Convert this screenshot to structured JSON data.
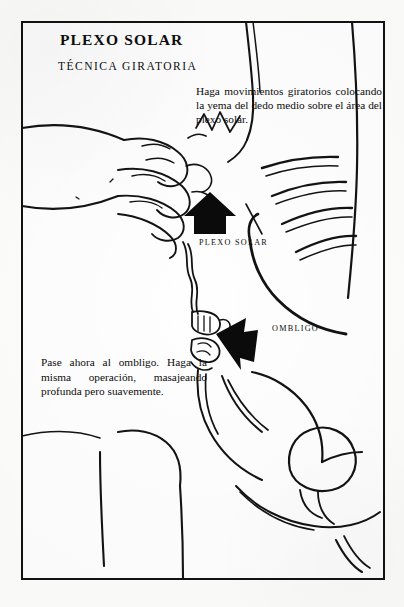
{
  "page": {
    "title": "PLEXO SOLAR",
    "subtitle": "TÉCNICA GIRATORIA",
    "background_color": "#fdfdfc",
    "ink_color": "#121212"
  },
  "instructions": {
    "top": "Haga movimientos giratorios colocando la yema del dedo medio sobre el área del plexo solar.",
    "bottom": "Pase ahora al ombligo. Haga la misma operación, masajeando profunda pero suavemente."
  },
  "anatomy_labels": [
    {
      "id": "plexo-solar",
      "text": "PLEXO SOLAR"
    },
    {
      "id": "ombligo",
      "text": "OMBLIGO"
    }
  ],
  "figure": {
    "arrows": [
      {
        "id": "arrow-plexo-solar",
        "direction": "up",
        "color": "#0b0b0b"
      },
      {
        "id": "arrow-ombligo",
        "direction": "left",
        "color": "#0b0b0b"
      }
    ]
  }
}
